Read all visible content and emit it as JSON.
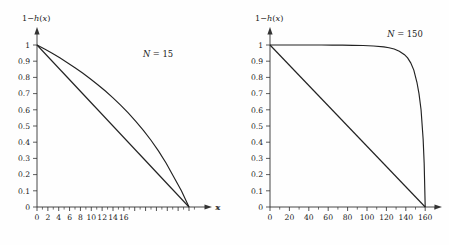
{
  "figure": {
    "background_color": "#fefefe",
    "line_color": "#222222",
    "axis_color": "#333333",
    "text_color": "#1a1a1a"
  },
  "panels": [
    {
      "id": "panel-left",
      "annotation": "N = 15",
      "annotation_symbol": "N",
      "annotation_equals": "=",
      "annotation_value": "15",
      "ylabel": "1−h(x)",
      "xlabel": "x",
      "x_ticks": [
        "0",
        "2",
        "4",
        "6",
        "8",
        "10",
        "12",
        "14",
        "16"
      ],
      "y_ticks": [
        "0",
        "0.1",
        "0.2",
        "0.3",
        "0.4",
        "0.5",
        "0.6",
        "0.7",
        "0.8",
        "0.9",
        "1"
      ]
    },
    {
      "id": "panel-right",
      "annotation": "N = 150",
      "annotation_symbol": "N",
      "annotation_equals": "=",
      "annotation_value": "150",
      "ylabel": "1−h(x)",
      "xlabel": "x",
      "x_ticks": [
        "0",
        "20",
        "40",
        "60",
        "80",
        "100",
        "120",
        "140",
        "160"
      ],
      "y_ticks": [
        "0",
        "0.1",
        "0.2",
        "0.3",
        "0.4",
        "0.5",
        "0.6",
        "0.7",
        "0.8",
        "0.9",
        "1"
      ]
    }
  ],
  "chart_data": [
    {
      "type": "line",
      "title": "",
      "subtitle": "",
      "annotation": "N = 15",
      "xlabel": "x",
      "ylabel": "1−h(x)",
      "xlim": [
        0,
        17
      ],
      "ylim": [
        0,
        1.08
      ],
      "x_ticks": [
        0,
        2,
        4,
        6,
        8,
        10,
        12,
        14,
        16
      ],
      "y_ticks": [
        0,
        0.1,
        0.2,
        0.3,
        0.4,
        0.5,
        0.6,
        0.7,
        0.8,
        0.9,
        1
      ],
      "grid": false,
      "legend": "none",
      "series": [
        {
          "name": "curve",
          "x": [
            0,
            0.75,
            1.5,
            2.25,
            3,
            3.75,
            4.5,
            5.25,
            6,
            6.75,
            7.5,
            8.25,
            9,
            9.75,
            10.5,
            11.25,
            12,
            12.75,
            13.5,
            14.25,
            15
          ],
          "values": [
            1.0,
            0.975,
            0.949,
            0.921,
            0.891,
            0.86,
            0.827,
            0.792,
            0.755,
            0.716,
            0.674,
            0.629,
            0.581,
            0.529,
            0.473,
            0.412,
            0.345,
            0.27,
            0.185,
            0.1,
            0.0
          ]
        },
        {
          "name": "straight-line",
          "x": [
            0,
            15
          ],
          "values": [
            1.0,
            0.0
          ]
        }
      ]
    },
    {
      "type": "line",
      "title": "",
      "subtitle": "",
      "annotation": "N = 150",
      "xlabel": "x",
      "ylabel": "1−h(x)",
      "xlim": [
        0,
        170
      ],
      "ylim": [
        0,
        1.08
      ],
      "x_ticks": [
        0,
        20,
        40,
        60,
        80,
        100,
        120,
        140,
        160
      ],
      "y_ticks": [
        0,
        0.1,
        0.2,
        0.3,
        0.4,
        0.5,
        0.6,
        0.7,
        0.8,
        0.9,
        1
      ],
      "grid": false,
      "legend": "none",
      "series": [
        {
          "name": "curve",
          "x": [
            0,
            10,
            20,
            30,
            40,
            50,
            60,
            70,
            80,
            90,
            100,
            110,
            115,
            120,
            125,
            130,
            133,
            136,
            139,
            142,
            144,
            146,
            148,
            149,
            150
          ],
          "values": [
            1.0,
            1.0,
            1.0,
            1.0,
            1.0,
            1.0,
            0.999,
            0.999,
            0.998,
            0.997,
            0.994,
            0.988,
            0.983,
            0.975,
            0.962,
            0.94,
            0.92,
            0.89,
            0.845,
            0.77,
            0.7,
            0.6,
            0.42,
            0.27,
            0.0
          ]
        },
        {
          "name": "straight-line",
          "x": [
            0,
            150
          ],
          "values": [
            1.0,
            0.0
          ]
        }
      ]
    }
  ]
}
